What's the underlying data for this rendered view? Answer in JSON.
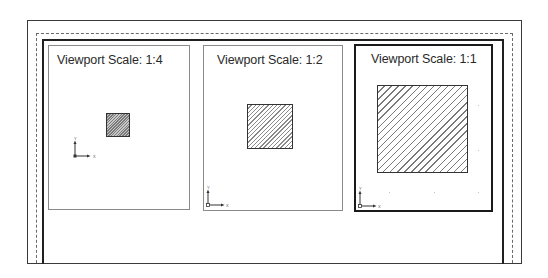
{
  "drawing": {
    "layout_frame": {
      "stroke": "#3a3a3a"
    },
    "printable_area": {
      "style": "dashed",
      "stroke": "#6a6a6a"
    },
    "paper_frame": {
      "stroke": "#202020"
    }
  },
  "viewports": [
    {
      "title": "Viewport Scale: 1:4",
      "scale": "1:4",
      "active": false,
      "object": "hatched-square",
      "ucs": {
        "x_label": "X",
        "y_label": "Y"
      }
    },
    {
      "title": "Viewport Scale: 1:2",
      "scale": "1:2",
      "active": false,
      "object": "hatched-square",
      "ucs": {
        "x_label": "X",
        "y_label": "Y"
      }
    },
    {
      "title": "Viewport Scale: 1:1",
      "scale": "1:1",
      "active": true,
      "object": "hatched-square",
      "ucs": {
        "x_label": "X",
        "y_label": "Y"
      }
    }
  ]
}
